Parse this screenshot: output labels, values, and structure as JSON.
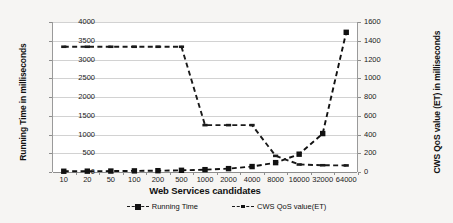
{
  "chart_data": {
    "type": "line",
    "title": "",
    "xlabel": "Web Services candidates",
    "categories": [
      "10",
      "20",
      "50",
      "100",
      "200",
      "500",
      "1000",
      "2000",
      "4000",
      "8000",
      "16000",
      "32000",
      "64000"
    ],
    "grid": true,
    "legend_position": "bottom",
    "axes": {
      "left": {
        "label": "Running Time in milliseconds",
        "ticks": [
          "0",
          "500",
          "1000",
          "1500",
          "2000",
          "2500",
          "3000",
          "3500",
          "4000"
        ],
        "min": 0,
        "max": 4000,
        "step": 500
      },
      "right": {
        "label": "CWS QoS value (ET) in milliseconds",
        "ticks": [
          "0",
          "200",
          "400",
          "600",
          "800",
          "1000",
          "1200",
          "1400",
          "1600"
        ],
        "min": 0,
        "max": 1600,
        "step": 200
      }
    },
    "series": [
      {
        "name": "Running Time",
        "axis": "right",
        "marker": "square",
        "line_style": "dashed",
        "color": "#111111",
        "values": [
          8,
          9,
          10,
          12,
          14,
          18,
          25,
          36,
          58,
          100,
          190,
          410,
          1490
        ]
      },
      {
        "name": "CWS QoS value(ET)",
        "axis": "left",
        "marker": "dash",
        "line_style": "dashed",
        "color": "#1a1a1a",
        "values": [
          3340,
          3340,
          3340,
          3340,
          3340,
          3340,
          1250,
          1250,
          1250,
          430,
          200,
          180,
          175
        ]
      }
    ]
  },
  "legend": {
    "items": [
      {
        "label": "Running Time",
        "marker": "square"
      },
      {
        "label": "CWS QoS value(ET)",
        "marker": "dash"
      }
    ]
  }
}
